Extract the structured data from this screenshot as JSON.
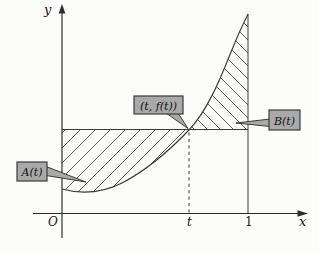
{
  "figure": {
    "y_axis_label": "y",
    "x_axis_label": "x",
    "origin_label": "O",
    "t_tick_label": "t",
    "one_tick_label": "1",
    "point_callout_label": "(t, f(t))",
    "area_left_callout_label": "A(t)",
    "area_right_callout_label": "B(t)",
    "colors": {
      "background": "#fcfcfa",
      "line": "#2e2e2e",
      "hatch": "#474747",
      "callout_fill": "#a9a9a9",
      "callout_border": "#3b3b3b",
      "text": "#141414"
    }
  }
}
